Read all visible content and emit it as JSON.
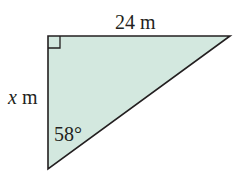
{
  "diagram": {
    "type": "right-triangle",
    "fill_color": "#d3e8df",
    "stroke_color": "#231f20",
    "labels": {
      "top_side": "24 m",
      "left_side_var": "x",
      "left_side_unit": " m",
      "angle": "58°"
    },
    "right_angle_marker": "top-left vertex",
    "vertices": {
      "top_left": [
        48,
        36
      ],
      "top_right": [
        230,
        36
      ],
      "bottom": [
        48,
        169
      ]
    }
  }
}
